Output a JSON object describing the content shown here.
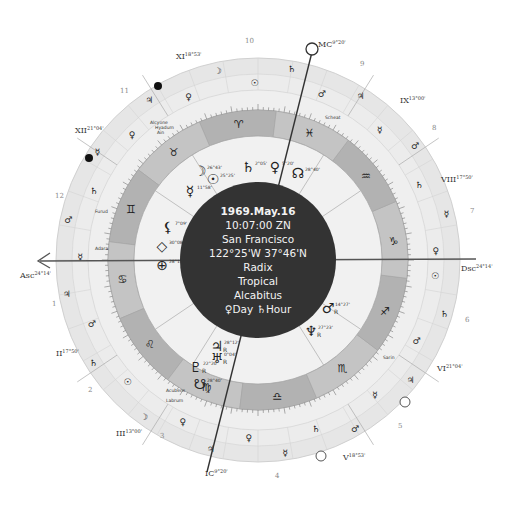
{
  "center": {
    "date": "1969.May.16",
    "time": "10:07:00 ZN",
    "place": "San Francisco",
    "coords": "122°25'W 37°46'N",
    "chart_type": "Radix",
    "zodiac": "Tropical",
    "house_system": "Alcabitus",
    "day_hour": "♀Day ♄Hour"
  },
  "angles": {
    "asc": {
      "label": "Asc",
      "degree": "24°14'"
    },
    "dsc": {
      "label": "Dsc",
      "degree": "24°14'"
    },
    "mc": {
      "label": "MC",
      "degree": "9°20'"
    },
    "ic": {
      "label": "IC",
      "degree": "9°20'"
    }
  },
  "house_cusps": [
    {
      "label": "XI",
      "degree": "18°53'"
    },
    {
      "label": "XII",
      "degree": "21°04'"
    },
    {
      "label": "II",
      "degree": "17°50'"
    },
    {
      "label": "III",
      "degree": "13°00'"
    },
    {
      "label": "V",
      "degree": "18°53'"
    },
    {
      "label": "VI",
      "degree": "21°04'"
    },
    {
      "label": "VIII",
      "degree": "17°50'"
    },
    {
      "label": "IX",
      "degree": "13°00'"
    }
  ],
  "house_numbers": [
    "10",
    "9",
    "8",
    "7",
    "6",
    "5",
    "4",
    "3",
    "2",
    "1",
    "12",
    "11"
  ],
  "signs": [
    "♈",
    "♉",
    "♊",
    "♋",
    "♌",
    "♍",
    "♎",
    "♏",
    "♐",
    "♑",
    "♒",
    "♓"
  ],
  "planets": [
    {
      "name": "Moon",
      "glyph": "☽",
      "degree": "26°43'"
    },
    {
      "name": "Sun",
      "glyph": "☉",
      "degree": "25°25'"
    },
    {
      "name": "Mercury",
      "glyph": "☿",
      "degree": "11°58'"
    },
    {
      "name": "Saturn",
      "glyph": "♄",
      "degree": "2°05'"
    },
    {
      "name": "Venus",
      "glyph": "♀",
      "degree": "5°20'"
    },
    {
      "name": "North Node",
      "glyph": "☊",
      "degree": "28°40'"
    },
    {
      "name": "Lilith",
      "glyph": "⚸",
      "degree": "7°09'"
    },
    {
      "name": "Vertex",
      "glyph": "◇",
      "degree": "30°08'"
    },
    {
      "name": "Part of Fortune",
      "glyph": "⊕",
      "degree": "28°18'"
    },
    {
      "name": "Jupiter",
      "glyph": "♃",
      "degree": "28°12'",
      "retro": "R"
    },
    {
      "name": "Uranus",
      "glyph": "♅",
      "degree": "0°04'",
      "retro": "R"
    },
    {
      "name": "Pluto",
      "glyph": "♇",
      "degree": "22°20'",
      "retro": "R"
    },
    {
      "name": "South Node",
      "glyph": "☋",
      "degree": "28°40'"
    },
    {
      "name": "Mars",
      "glyph": "♂",
      "degree": "14°27'",
      "retro": "R"
    },
    {
      "name": "Neptune",
      "glyph": "♆",
      "degree": "27°23'",
      "retro": "R"
    }
  ],
  "fixed_stars": [
    "Alcyone",
    "Hyadum",
    "Ain",
    "Algol",
    "Scheat",
    "Furud",
    "Adara",
    "Sirrah",
    "Acubens",
    "Labrum",
    "Sarin"
  ],
  "retro_label": "R"
}
